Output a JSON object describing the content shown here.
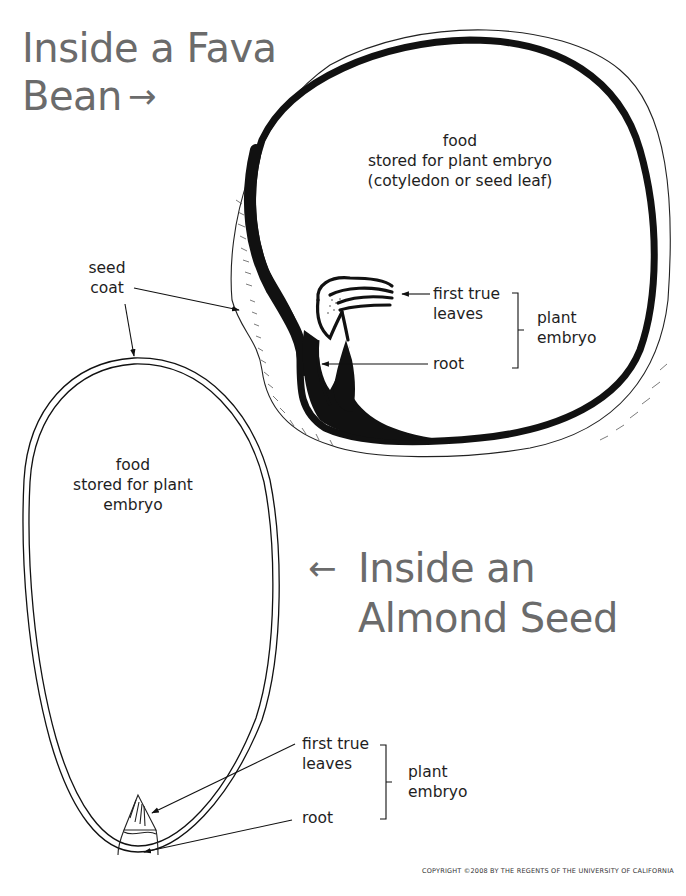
{
  "titles": {
    "fava": {
      "line1": "Inside a Fava",
      "line2": "Bean",
      "arrow": "→"
    },
    "almond": {
      "line1": "Inside an",
      "line2": "Almond Seed",
      "arrow": "←"
    }
  },
  "fava": {
    "food_label": {
      "line1": "food",
      "line2": "stored for plant embryo",
      "line3": "(cotyledon or seed leaf)"
    },
    "first_true_leaves": {
      "line1": "first true",
      "line2": "leaves"
    },
    "root": "root",
    "plant_embryo": {
      "line1": "plant",
      "line2": "embryo"
    }
  },
  "shared": {
    "seed_coat": {
      "line1": "seed",
      "line2": "coat"
    }
  },
  "almond": {
    "food_label": {
      "line1": "food",
      "line2": "stored for plant",
      "line3": "embryo"
    },
    "first_true_leaves": {
      "line1": "first true",
      "line2": "leaves"
    },
    "root": "root",
    "plant_embryo": {
      "line1": "plant",
      "line2": "embryo"
    }
  },
  "copyright": "COPYRIGHT ©2008 BY THE REGENTS OF THE UNIVERSITY OF CALIFORNIA",
  "colors": {
    "title": "#6b6b6b",
    "ink": "#111111",
    "text": "#1e1e1e",
    "background": "#ffffff"
  }
}
